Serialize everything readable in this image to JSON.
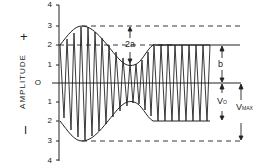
{
  "diagram": {
    "type": "amplitude-modulated waveform",
    "y_axis": {
      "label": "AMPLITUDE",
      "positive_sign": "+",
      "negative_sign": "I",
      "ticks": [
        {
          "label": "4",
          "value": 4
        },
        {
          "label": "3",
          "value": 3
        },
        {
          "label": "2",
          "value": 2
        },
        {
          "label": "1",
          "value": 1
        },
        {
          "label": "O",
          "value": 0
        },
        {
          "label": "1",
          "value": -1
        },
        {
          "label": "2",
          "value": -2
        },
        {
          "label": "3",
          "value": -3
        },
        {
          "label": "4",
          "value": -4
        }
      ]
    },
    "annotations": {
      "two_a": "2a",
      "b": "b",
      "v0": "V",
      "v0_sub": "O",
      "vmax": "V",
      "vmax_sub": "MAX"
    },
    "envelope": {
      "start": 2,
      "peak": 3,
      "trough": 1.1,
      "steady": 2
    }
  }
}
